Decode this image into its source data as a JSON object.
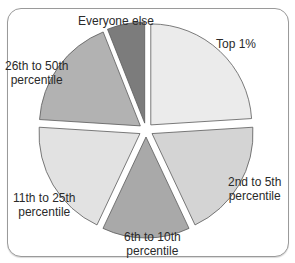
{
  "chart_data": {
    "type": "pie",
    "title": "",
    "exploded": true,
    "start_angle_deg": -90,
    "direction": "clockwise",
    "slices": [
      {
        "label": "Top 1%",
        "value": 24,
        "color": "#ebebeb"
      },
      {
        "label": "2nd to 5th percentile",
        "value": 19,
        "color": "#d4d4d4"
      },
      {
        "label": "6th to 10th percentile",
        "value": 14,
        "color": "#a9a9a9"
      },
      {
        "label": "11th to 25th percentile",
        "value": 19,
        "color": "#e2e2e2"
      },
      {
        "label": "26th to 50th percentile",
        "value": 18,
        "color": "#b2b2b2"
      },
      {
        "label": "Everyone else",
        "value": 6,
        "color": "#7c7c7c"
      }
    ]
  },
  "labels": {
    "top1": "Top 1%",
    "p2_5": "2nd to 5th\npercentile",
    "p6_10": "6th to 10th\npercentile",
    "p11_25": "11th to 25th\npercentile",
    "p26_50": "26th to 50th\npercentile",
    "everyone_else": "Everyone else"
  }
}
